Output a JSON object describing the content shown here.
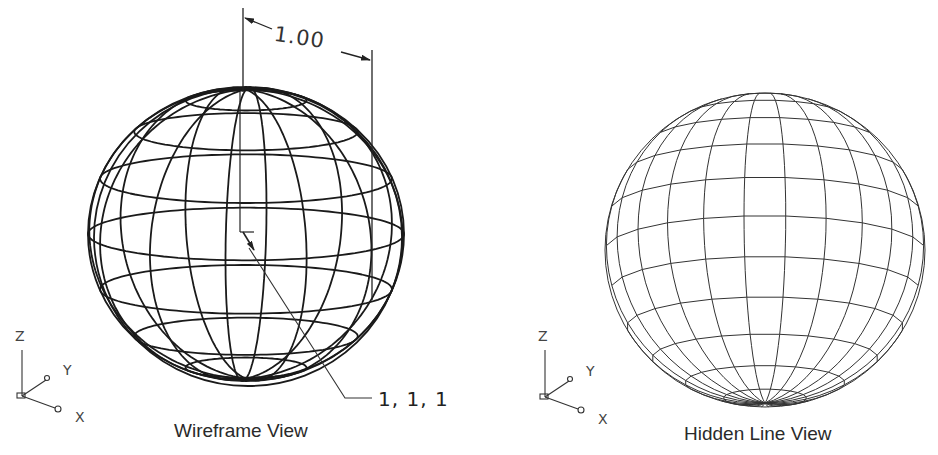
{
  "figure": {
    "panels": [
      {
        "id": "wireframe",
        "caption": "Wireframe View",
        "style": "wireframe",
        "sphere": {
          "cx": 246,
          "cy": 234,
          "rx": 158,
          "ry": 147,
          "meridians": 12,
          "parallels": 7,
          "stroke": "#1a1a1a",
          "stroke_width": 1.8
        },
        "dimension": {
          "label": "1.00",
          "x1": 243,
          "x2": 372,
          "y": 30
        },
        "leader": {
          "label": "1, 1, 1"
        },
        "ucs": {
          "z": "Z",
          "y": "Y",
          "x": "X"
        }
      },
      {
        "id": "hidden-line",
        "caption": "Hidden Line View",
        "style": "hidden-line",
        "sphere": {
          "cx": 765,
          "cy": 250,
          "rx": 160,
          "ry": 157,
          "meridians": 24,
          "parallels": 11,
          "stroke": "#333333",
          "stroke_width": 1
        },
        "ucs": {
          "z": "Z",
          "y": "Y",
          "x": "X"
        }
      }
    ]
  }
}
